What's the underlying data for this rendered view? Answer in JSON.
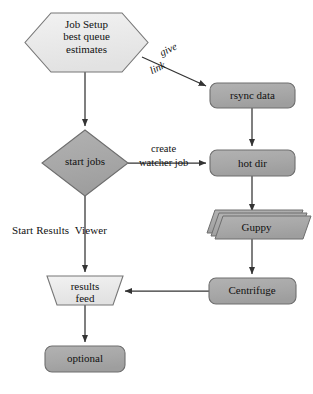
{
  "diagram": {
    "colors": {
      "node_light_fill": "#ebebeb",
      "node_gray_fill": "#a9a9a9",
      "node_stroke": "#6e6e6e",
      "edge_stroke": "#3a3a3a",
      "text": "#111111",
      "background": "#ffffff"
    },
    "nodes": [
      {
        "id": "job-setup",
        "shape": "hexagon",
        "label": "Job Setup\nbest queue\nestimates",
        "fill": "#ebebeb"
      },
      {
        "id": "start-jobs",
        "shape": "diamond",
        "label": "start jobs",
        "fill": "#a9a9a9"
      },
      {
        "id": "results-feed",
        "shape": "trapezoid",
        "label": "results\nfeed",
        "fill": "#ebebeb"
      },
      {
        "id": "optional",
        "shape": "rounded-rectangle",
        "label": "optional",
        "fill": "#a9a9a9"
      },
      {
        "id": "rsync-data",
        "shape": "rounded-rectangle",
        "label": "rsync data",
        "fill": "#a9a9a9"
      },
      {
        "id": "hot-dir",
        "shape": "rounded-rectangle",
        "label": "hot dir",
        "fill": "#a9a9a9"
      },
      {
        "id": "guppy",
        "shape": "stacked-parallelogram",
        "label": "Guppy",
        "fill": "#a9a9a9"
      },
      {
        "id": "centrifuge",
        "shape": "rounded-rectangle",
        "label": "Centrifuge",
        "fill": "#a9a9a9"
      }
    ],
    "edges": [
      {
        "id": "job-setup-to-rsync",
        "from": "job-setup",
        "to": "rsync-data",
        "label_line1": "give",
        "label_line2": "link",
        "style": "italic"
      },
      {
        "id": "job-setup-to-start-jobs",
        "from": "job-setup",
        "to": "start-jobs",
        "label": ""
      },
      {
        "id": "rsync-to-hot-dir",
        "from": "rsync-data",
        "to": "hot-dir",
        "label": ""
      },
      {
        "id": "start-jobs-to-hot-dir",
        "from": "start-jobs",
        "to": "hot-dir",
        "label_line1": "create",
        "label_line2": "watcher job",
        "style": "upright"
      },
      {
        "id": "hot-dir-to-guppy",
        "from": "hot-dir",
        "to": "guppy",
        "label": ""
      },
      {
        "id": "guppy-to-centrifuge",
        "from": "guppy",
        "to": "centrifuge",
        "label": ""
      },
      {
        "id": "centrifuge-to-results-feed",
        "from": "centrifuge",
        "to": "results-feed",
        "label": ""
      },
      {
        "id": "start-jobs-to-results-feed",
        "from": "start-jobs",
        "to": "results-feed",
        "label": "Start Results  Viewer",
        "style": "upright"
      },
      {
        "id": "results-feed-to-optional",
        "from": "results-feed",
        "to": "optional",
        "label": ""
      }
    ],
    "labels": {
      "give": "give",
      "link": "link",
      "create": "create",
      "watcher_job": "watcher job",
      "start_results_viewer": "Start Results  Viewer"
    }
  }
}
